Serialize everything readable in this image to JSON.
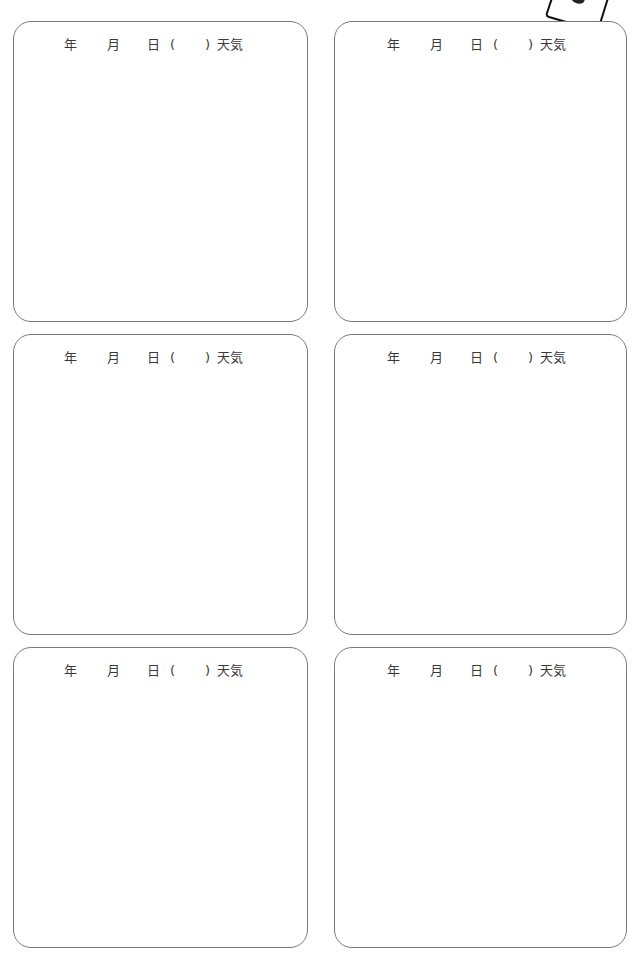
{
  "page": {
    "cards": [
      {
        "year": "年",
        "month": "月",
        "day": "日",
        "open_paren": "(",
        "close_paren": ")",
        "weather": "天気"
      },
      {
        "year": "年",
        "month": "月",
        "day": "日",
        "open_paren": "(",
        "close_paren": ")",
        "weather": "天気"
      },
      {
        "year": "年",
        "month": "月",
        "day": "日",
        "open_paren": "(",
        "close_paren": ")",
        "weather": "天気"
      },
      {
        "year": "年",
        "month": "月",
        "day": "日",
        "open_paren": "(",
        "close_paren": ")",
        "weather": "天気"
      },
      {
        "year": "年",
        "month": "月",
        "day": "日",
        "open_paren": "(",
        "close_paren": ")",
        "weather": "天気"
      },
      {
        "year": "年",
        "month": "月",
        "day": "日",
        "open_paren": "(",
        "close_paren": ")",
        "weather": "天気"
      }
    ],
    "corner_badge_icon": "tilted-card-icon",
    "colors": {
      "border": "#7a7a7a",
      "text": "#3a3a3a",
      "badge_stroke": "#111111"
    }
  }
}
